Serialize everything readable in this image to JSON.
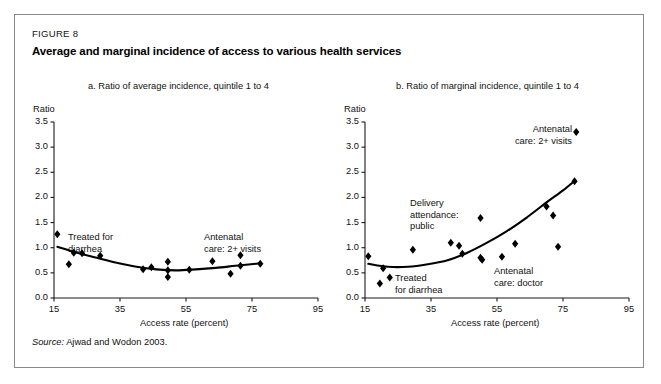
{
  "figure": {
    "label": "FIGURE 8",
    "title": "Average and marginal incidence of access to various health services",
    "source_word": "Source:",
    "source_text": "Ajwad and Wodon 2003."
  },
  "chart_data": [
    {
      "type": "scatter",
      "panel": "a",
      "title": "a. Ratio of average incidence, quintile 1 to 4",
      "xlabel": "Access rate (percent)",
      "ylabel": "Ratio",
      "xlim": [
        15,
        95
      ],
      "ylim": [
        0.0,
        3.5
      ],
      "xticks": [
        15,
        35,
        55,
        75,
        95
      ],
      "xtick_labels": [
        "15",
        "35",
        "55",
        "75",
        "95"
      ],
      "yticks": [
        0.0,
        0.5,
        1.0,
        1.5,
        2.0,
        2.5,
        3.0,
        3.5
      ],
      "ytick_labels": [
        "0.0",
        "0.5",
        "1.0",
        "1.5",
        "2.0",
        "2.5",
        "3.0",
        "3.5"
      ],
      "grid": false,
      "legend": "none",
      "points": [
        {
          "x": 16.0,
          "y": 1.27
        },
        {
          "x": 19.5,
          "y": 0.67
        },
        {
          "x": 21.0,
          "y": 0.9
        },
        {
          "x": 23.5,
          "y": 0.89
        },
        {
          "x": 29.0,
          "y": 0.84
        },
        {
          "x": 42.0,
          "y": 0.57
        },
        {
          "x": 44.5,
          "y": 0.61
        },
        {
          "x": 49.5,
          "y": 0.72
        },
        {
          "x": 49.5,
          "y": 0.55
        },
        {
          "x": 49.5,
          "y": 0.42
        },
        {
          "x": 56.0,
          "y": 0.56
        },
        {
          "x": 63.0,
          "y": 0.73
        },
        {
          "x": 68.5,
          "y": 0.48
        },
        {
          "x": 71.5,
          "y": 0.85
        },
        {
          "x": 71.5,
          "y": 0.64
        },
        {
          "x": 77.5,
          "y": 0.68
        }
      ],
      "trend": [
        {
          "x": 16.0,
          "y": 1.02
        },
        {
          "x": 22.0,
          "y": 0.9
        },
        {
          "x": 28.0,
          "y": 0.8
        },
        {
          "x": 34.0,
          "y": 0.7
        },
        {
          "x": 40.0,
          "y": 0.62
        },
        {
          "x": 46.0,
          "y": 0.57
        },
        {
          "x": 52.0,
          "y": 0.55
        },
        {
          "x": 58.0,
          "y": 0.57
        },
        {
          "x": 64.0,
          "y": 0.6
        },
        {
          "x": 70.0,
          "y": 0.64
        },
        {
          "x": 77.5,
          "y": 0.69
        }
      ],
      "annotations": [
        {
          "name": "treated-for-diarrhea",
          "lines": [
            "Treated for",
            "diarrhea"
          ],
          "align": "left"
        },
        {
          "name": "antenatal-care-2-visits",
          "lines": [
            "Antenatal",
            "care: 2+ visits"
          ],
          "align": "left"
        }
      ]
    },
    {
      "type": "scatter",
      "panel": "b",
      "title": "b. Ratio of marginal incidence, quintile 1 to 4",
      "xlabel": "Access rate (percent)",
      "ylabel": "Ratio",
      "xlim": [
        15,
        95
      ],
      "ylim": [
        0.0,
        3.5
      ],
      "xticks": [
        15,
        35,
        55,
        75,
        95
      ],
      "xtick_labels": [
        "15",
        "35",
        "55",
        "75",
        "95"
      ],
      "yticks": [
        0.0,
        0.5,
        1.0,
        1.5,
        2.0,
        2.5,
        3.0,
        3.5
      ],
      "ytick_labels": [
        "0.0",
        "0.5",
        "1.0",
        "1.5",
        "2.0",
        "2.5",
        "3.0",
        "3.5"
      ],
      "grid": false,
      "legend": "none",
      "points": [
        {
          "x": 16.0,
          "y": 0.83
        },
        {
          "x": 19.5,
          "y": 0.29
        },
        {
          "x": 20.5,
          "y": 0.59
        },
        {
          "x": 22.5,
          "y": 0.41
        },
        {
          "x": 29.5,
          "y": 0.96
        },
        {
          "x": 41.0,
          "y": 1.1
        },
        {
          "x": 43.5,
          "y": 1.04
        },
        {
          "x": 44.5,
          "y": 0.88
        },
        {
          "x": 50.0,
          "y": 1.59
        },
        {
          "x": 50.0,
          "y": 0.8
        },
        {
          "x": 50.5,
          "y": 0.76
        },
        {
          "x": 56.5,
          "y": 0.82
        },
        {
          "x": 60.5,
          "y": 1.08
        },
        {
          "x": 70.0,
          "y": 1.82
        },
        {
          "x": 72.0,
          "y": 1.64
        },
        {
          "x": 73.5,
          "y": 1.02
        },
        {
          "x": 78.5,
          "y": 2.32
        },
        {
          "x": 79.0,
          "y": 3.3
        }
      ],
      "trend": [
        {
          "x": 16.0,
          "y": 0.68
        },
        {
          "x": 22.0,
          "y": 0.62
        },
        {
          "x": 28.0,
          "y": 0.62
        },
        {
          "x": 34.0,
          "y": 0.67
        },
        {
          "x": 40.0,
          "y": 0.75
        },
        {
          "x": 46.0,
          "y": 0.9
        },
        {
          "x": 52.0,
          "y": 1.1
        },
        {
          "x": 58.0,
          "y": 1.33
        },
        {
          "x": 64.0,
          "y": 1.6
        },
        {
          "x": 70.0,
          "y": 1.9
        },
        {
          "x": 75.0,
          "y": 2.14
        },
        {
          "x": 78.5,
          "y": 2.33
        }
      ],
      "annotations": [
        {
          "name": "delivery-attendance-public",
          "lines": [
            "Delivery",
            "attendance:",
            "public"
          ],
          "align": "left"
        },
        {
          "name": "treated-for-diarrhea",
          "lines": [
            "Treated",
            "for diarrhea"
          ],
          "align": "left"
        },
        {
          "name": "antenatal-care-doctor",
          "lines": [
            "Antenatal",
            "care: doctor"
          ],
          "align": "left"
        },
        {
          "name": "antenatal-care-2-visits",
          "lines": [
            "Antenatal",
            "care: 2+ visits"
          ],
          "align": "right"
        }
      ]
    }
  ]
}
